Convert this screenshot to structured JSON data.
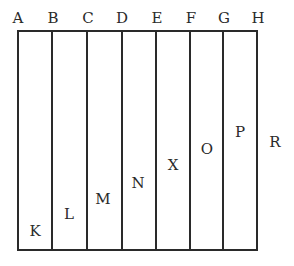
{
  "diagram": {
    "type": "rectangle divided into vertical strips",
    "line_color": "#2a2a2a",
    "background": "#ffffff",
    "frame": {
      "left": 18,
      "top": 31,
      "right": 257,
      "bottom": 250
    },
    "dividers_x": [
      52,
      87,
      122,
      156,
      190,
      223
    ],
    "top_labels": [
      {
        "text": "A",
        "x": 18,
        "y": 18
      },
      {
        "text": "B",
        "x": 53,
        "y": 18
      },
      {
        "text": "C",
        "x": 88,
        "y": 18
      },
      {
        "text": "D",
        "x": 122,
        "y": 18
      },
      {
        "text": "E",
        "x": 157,
        "y": 18
      },
      {
        "text": "F",
        "x": 191,
        "y": 18
      },
      {
        "text": "G",
        "x": 224,
        "y": 18
      },
      {
        "text": "H",
        "x": 258,
        "y": 18
      }
    ],
    "strip_labels": [
      {
        "text": "K",
        "x": 35,
        "y": 231
      },
      {
        "text": "L",
        "x": 69,
        "y": 214
      },
      {
        "text": "M",
        "x": 103,
        "y": 199
      },
      {
        "text": "N",
        "x": 138,
        "y": 183
      },
      {
        "text": "X",
        "x": 173,
        "y": 165
      },
      {
        "text": "O",
        "x": 207,
        "y": 149
      },
      {
        "text": "P",
        "x": 240,
        "y": 132
      }
    ],
    "outside_label": {
      "text": "R",
      "x": 275,
      "y": 142
    }
  }
}
